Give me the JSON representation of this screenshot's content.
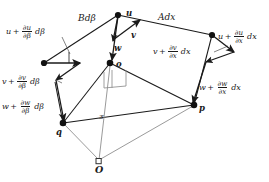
{
  "figure": {
    "type": "vector-displacement-diagram",
    "background": "#ffffff",
    "ink": "#1a1a1a"
  },
  "nodes": [
    {
      "id": "o",
      "label": "o",
      "x": 110,
      "y": 63,
      "marker": "filled-dot"
    },
    {
      "id": "p",
      "label": "p",
      "x": 194,
      "y": 105,
      "marker": "filled-dot"
    },
    {
      "id": "q",
      "label": "q",
      "x": 63,
      "y": 123,
      "marker": "filled-dot"
    },
    {
      "id": "O",
      "label": "O",
      "x": 99,
      "y": 162,
      "marker": "open-square"
    },
    {
      "id": "top",
      "label": "u",
      "x": 118,
      "y": 15,
      "marker": "filled-dot"
    },
    {
      "id": "left",
      "label": "",
      "x": 44,
      "y": 63,
      "marker": "filled-dot"
    },
    {
      "id": "right",
      "label": "",
      "x": 212,
      "y": 35,
      "marker": "filled-dot"
    }
  ],
  "edge_labels": {
    "b_dbeta": {
      "lead": "B",
      "tail": "dβ"
    },
    "a_dx": {
      "lead": "A",
      "tail": "dx"
    }
  },
  "center_labels": {
    "u": "u",
    "v": "v",
    "w": "w",
    "z": "z"
  },
  "beta_labels": [
    {
      "id": "u-beta",
      "base": "u",
      "op": "+",
      "num": "∂u",
      "den": "∂β",
      "tail": "dβ"
    },
    {
      "id": "v-beta",
      "base": "v",
      "op": "+",
      "num": "∂v",
      "den": "∂β",
      "tail": "dβ"
    },
    {
      "id": "w-beta",
      "base": "w",
      "op": "+",
      "num": "∂w",
      "den": "∂β",
      "tail": "dβ"
    }
  ],
  "x_labels": [
    {
      "id": "u-x",
      "base": "u",
      "op": "+",
      "num": "∂u",
      "den": "∂x",
      "tail": "dx"
    },
    {
      "id": "v-x",
      "base": "v",
      "op": "+",
      "num": "∂v",
      "den": "∂x",
      "tail": "dx"
    },
    {
      "id": "w-x",
      "base": "w",
      "op": "+",
      "num": "∂w",
      "den": "∂x",
      "tail": "dx"
    }
  ]
}
